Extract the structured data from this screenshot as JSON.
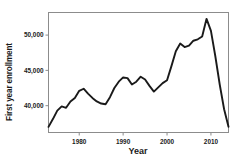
{
  "chart_data": {
    "type": "line",
    "title": "",
    "xlabel": "Year",
    "ylabel": "First year enrollment",
    "xlim": [
      1973,
      2014
    ],
    "ylim": [
      36200,
      53200
    ],
    "grid": false,
    "legend": null,
    "xticks": [
      1980,
      1990,
      2000,
      2010
    ],
    "xticklabels": [
      "1980",
      "1990",
      "2000",
      "2010"
    ],
    "yticks": [
      40000,
      45000,
      50000
    ],
    "yticklabels": [
      "40,000",
      "45,000",
      "50,000"
    ],
    "line_color": "#1a1a1a",
    "series": [
      {
        "name": "First year enrollment",
        "x": [
          1973,
          1974,
          1975,
          1976,
          1977,
          1978,
          1979,
          1980,
          1981,
          1982,
          1983,
          1984,
          1985,
          1986,
          1987,
          1988,
          1989,
          1990,
          1991,
          1992,
          1993,
          1994,
          1995,
          1996,
          1997,
          1998,
          1999,
          2000,
          2001,
          2002,
          2003,
          2004,
          2005,
          2006,
          2007,
          2008,
          2009,
          2010,
          2011,
          2012,
          2013,
          2014
        ],
        "values": [
          37000,
          38100,
          39300,
          39900,
          39700,
          40600,
          41100,
          42100,
          42400,
          41700,
          41100,
          40600,
          40300,
          40200,
          41200,
          42500,
          43400,
          44000,
          43900,
          43000,
          43400,
          44100,
          43700,
          42800,
          42000,
          42600,
          43200,
          43600,
          45600,
          47700,
          48800,
          48300,
          48500,
          49200,
          49400,
          49800,
          52300,
          50600,
          47000,
          43000,
          39500,
          37000
        ]
      }
    ]
  },
  "axis": {
    "y_title": "First year enrollment",
    "x_title": "Year"
  }
}
